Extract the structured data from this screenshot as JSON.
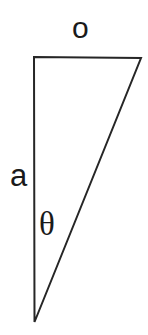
{
  "figure": {
    "type": "right-triangle-diagram",
    "background_color": "#ffffff",
    "stroke_color": "#262626",
    "stroke_width": 2,
    "canvas": {
      "width": 148,
      "height": 335
    },
    "vertices": {
      "top_left": {
        "x": 34,
        "y": 57
      },
      "top_right": {
        "x": 141,
        "y": 58
      },
      "bottom": {
        "x": 34.5,
        "y": 322
      }
    },
    "sides": [
      {
        "name": "opposite",
        "label": "o",
        "from": "top_left",
        "to": "top_right"
      },
      {
        "name": "adjacent",
        "label": "a",
        "from": "top_left",
        "to": "bottom"
      },
      {
        "name": "hypotenuse",
        "label": "",
        "from": "bottom",
        "to": "top_right"
      }
    ],
    "angle": {
      "name": "theta",
      "label": "θ",
      "at": "bottom"
    }
  },
  "labels": {
    "opposite": "o",
    "adjacent": "a",
    "theta": "θ"
  }
}
